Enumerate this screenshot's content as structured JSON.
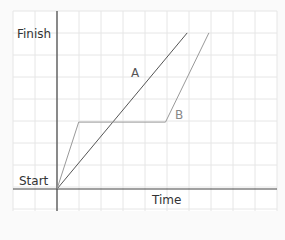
{
  "chart_data": {
    "type": "line",
    "title": "",
    "xlabel": "Time",
    "ylabel": "",
    "ytick_labels": [
      "Start",
      "Finish"
    ],
    "grid": true,
    "series": [
      {
        "name": "A",
        "points": [
          [
            0,
            0
          ],
          [
            6,
            7
          ]
        ],
        "color": "#555555"
      },
      {
        "name": "B",
        "points": [
          [
            0,
            0
          ],
          [
            1,
            3
          ],
          [
            5,
            3
          ],
          [
            7,
            7
          ]
        ],
        "color": "#999999"
      }
    ],
    "xlim": [
      -2,
      10
    ],
    "ylim": [
      -1,
      8
    ]
  },
  "labels": {
    "finish": "Finish",
    "start": "Start",
    "time": "Time",
    "series_a": "A",
    "series_b": "B"
  }
}
